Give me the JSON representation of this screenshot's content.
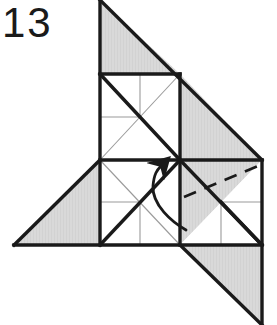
{
  "figure": {
    "step_number": "13",
    "type": "origami-folding-diagram",
    "caption": "",
    "canvas": {
      "width": 277,
      "height": 325
    }
  },
  "colors": {
    "paper_shaded": "#d9d9d9",
    "paper_white": "#ffffff",
    "stroke_heavy": "#1a1a1a",
    "stroke_light": "#9a9a9a",
    "background": "#ffffff",
    "label_color": "#1a1a1a"
  },
  "geometry": {
    "grid_origin_x": 100,
    "grid_origin_y": 74,
    "cell": 86,
    "note": "three unit squares: upper (100,74)-(180,160), lower (100,160)-(180,245), right (180,160)-(262,245)"
  },
  "shapes": {
    "top_triangle": {
      "name": "top-shaded-triangle",
      "points": "100,0 180,74 100,74",
      "fill": "shaded"
    },
    "upper_right_triangle": {
      "name": "upper-right-shaded-triangle",
      "points": "180,74 262,160 180,160",
      "fill": "shaded"
    },
    "left_triangle": {
      "name": "left-shaded-triangle",
      "points": "100,160 100,245 14,245",
      "fill": "shaded"
    },
    "right_inner_triangle": {
      "name": "right-square-shaded-triangle",
      "points": "180,160 262,160 180,245",
      "fill": "shaded"
    },
    "bottom_right_triangle": {
      "name": "bottom-right-shaded-triangle",
      "points": "180,245 262,245 262,325",
      "fill": "shaded"
    }
  },
  "annotations": {
    "fold_arrow": {
      "name": "fold-arrow",
      "label": "",
      "direction": "up-left",
      "style": "curved-solid-with-arrowhead"
    },
    "dashed_fold_line": {
      "name": "dashed-fold-line",
      "label": "",
      "style": "dashed",
      "from": "184,197",
      "to": "258,166"
    }
  },
  "creases": {
    "heavy": [
      "100,0 100,245",
      "100,0 262,160",
      "100,74 180,74",
      "180,74 180,245",
      "100,160 180,160",
      "100,245 180,245",
      "180,160 262,160",
      "180,245 262,245",
      "262,160 262,245",
      "100,74 180,160",
      "100,245 180,160",
      "100,160 14,245",
      "14,245 180,245",
      "180,160 262,245",
      "180,245 262,325",
      "262,245 262,325",
      "221,202 262,245"
    ],
    "light": [
      "100,74 180,160",
      "180,74 100,160",
      "140,74 140,117",
      "100,117 140,117",
      "100,160 180,245",
      "180,160 100,245",
      "140,202 140,245",
      "100,202 140,202",
      "221,202 262,202",
      "221,202 221,245"
    ]
  }
}
